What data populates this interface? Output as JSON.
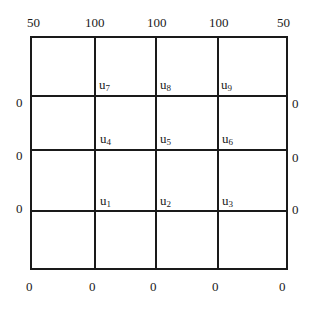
{
  "diagram": {
    "type": "finite-difference-grid",
    "grid": {
      "columns": 4,
      "rows": 4
    },
    "boundary": {
      "top": [
        "50",
        "100",
        "100",
        "100",
        "50"
      ],
      "bottom": [
        "0",
        "0",
        "0",
        "0",
        "0"
      ],
      "left": [
        "0",
        "0",
        "0"
      ],
      "right": [
        "0",
        "0",
        "0"
      ]
    },
    "nodes": [
      {
        "base": "u",
        "sub": "7"
      },
      {
        "base": "u",
        "sub": "8"
      },
      {
        "base": "u",
        "sub": "9"
      },
      {
        "base": "u",
        "sub": "4"
      },
      {
        "base": "u",
        "sub": "5"
      },
      {
        "base": "u",
        "sub": "6"
      },
      {
        "base": "u",
        "sub": "1"
      },
      {
        "base": "u",
        "sub": "2"
      },
      {
        "base": "u",
        "sub": "3"
      }
    ]
  }
}
